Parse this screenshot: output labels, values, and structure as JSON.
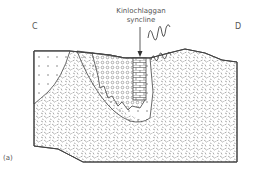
{
  "diagram": {
    "end_labels": {
      "left": "C",
      "right": "D"
    },
    "annotation": {
      "line1": "Kinlochlaggan",
      "line2": "syncline"
    },
    "figure_label": "(a)",
    "units": [
      {
        "id": "dotted",
        "pattern": "sparse dots"
      },
      {
        "id": "dashed",
        "pattern": "random short dashes"
      },
      {
        "id": "circles",
        "pattern": "small circles"
      },
      {
        "id": "brick",
        "pattern": "brick / limestone"
      }
    ],
    "colors": {
      "line": "#444444",
      "pattern": "#666666",
      "background": "#ffffff"
    }
  }
}
